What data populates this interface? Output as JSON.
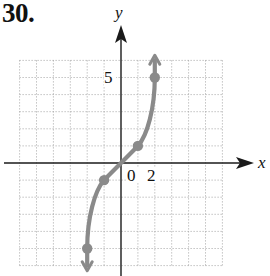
{
  "problem": {
    "number": "30."
  },
  "chart_data": {
    "type": "line",
    "title": "",
    "xlabel": "x",
    "ylabel": "y",
    "tick_labels": {
      "origin": "0",
      "x": "2",
      "y": "5"
    },
    "xlim": [
      -6,
      6
    ],
    "ylim": [
      -6,
      6
    ],
    "grid": true,
    "grid_style": "dotted",
    "series": [
      {
        "name": "curve",
        "points": [
          {
            "x": -2,
            "y": -5
          },
          {
            "x": -1,
            "y": -1
          },
          {
            "x": 0,
            "y": 0
          },
          {
            "x": 1,
            "y": 1
          },
          {
            "x": 2,
            "y": 5
          }
        ],
        "marked_points": [
          [
            -2,
            -5
          ],
          [
            -1,
            -1
          ],
          [
            1,
            1
          ],
          [
            2,
            5
          ]
        ],
        "arrows": [
          "up-end",
          "down-end"
        ],
        "color": "#8a8a8a"
      }
    ]
  },
  "colors": {
    "curve": "#8a8a8a",
    "axis": "#1a1a1a",
    "grid": "#9a9a9a",
    "text": "#111111"
  }
}
